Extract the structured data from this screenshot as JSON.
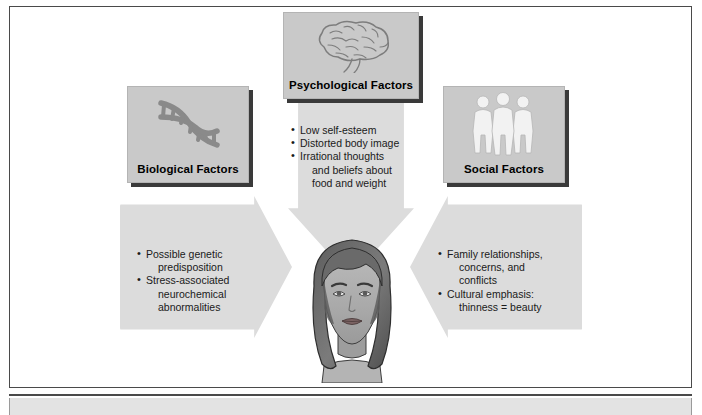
{
  "diagram": {
    "title_implied": "Factors contributing to eating disorders",
    "background_color": "#ffffff",
    "box_fill": "#c9c9c9",
    "arrow_fill": "#dcdcdc",
    "shadow_color": "#3a3a3a",
    "text_color": "#1a1a1a"
  },
  "boxes": [
    {
      "id": "biological",
      "label": "Biological Factors",
      "icon": "dna-helix-icon"
    },
    {
      "id": "psychological",
      "label": "Psychological Factors",
      "icon": "brain-icon"
    },
    {
      "id": "social",
      "label": "Social Factors",
      "icon": "three-people-icon"
    }
  ],
  "bullets": {
    "biological": [
      {
        "text": "Possible genetic",
        "cont": "predisposition"
      },
      {
        "text": "Stress-associated",
        "cont": "neurochemical",
        "cont2": "abnormalities"
      }
    ],
    "psychological": [
      {
        "text": "Low self-esteem"
      },
      {
        "text": "Distorted body image"
      },
      {
        "text": "Irrational thoughts",
        "cont": "and beliefs about",
        "cont2": "food and weight"
      }
    ],
    "social": [
      {
        "text": "Family relationships,",
        "cont": "concerns, and",
        "cont2": "conflicts"
      },
      {
        "text": "Cultural emphasis:",
        "cont": "thinness = beauty"
      }
    ]
  },
  "center": {
    "illustration": "womans-face-illustration"
  },
  "footer": {
    "band_color": "#e3e3e3"
  }
}
